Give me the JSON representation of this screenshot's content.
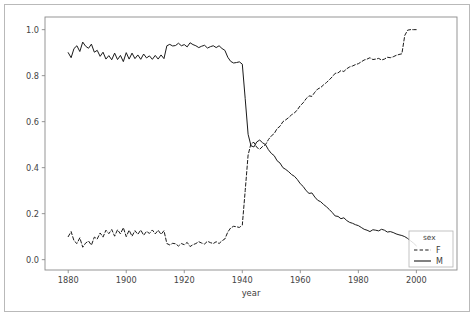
{
  "chart_data": {
    "type": "line",
    "title": "",
    "xlabel": "year",
    "ylabel": "",
    "xlim": [
      1872,
      2014
    ],
    "ylim": [
      -0.045,
      1.055
    ],
    "grid": false,
    "xticks": [
      1880,
      1900,
      1920,
      1940,
      1960,
      1980,
      2000
    ],
    "xtick_labels": [
      "1880",
      "1900",
      "1920",
      "1940",
      "1960",
      "1980",
      "2000"
    ],
    "yticks": [
      0.0,
      0.2,
      0.4,
      0.6,
      0.8,
      1.0
    ],
    "ytick_labels": [
      "0.0",
      "0.2",
      "0.4",
      "0.6",
      "0.8",
      "1.0"
    ],
    "legend": {
      "title": "sex",
      "position": "lower-right-inside",
      "entries": [
        {
          "name": "F",
          "style": "dashed",
          "color": "#1a1a1a"
        },
        {
          "name": "M",
          "style": "solid",
          "color": "#1a1a1a"
        }
      ]
    },
    "x": [
      1880,
      1881,
      1882,
      1883,
      1884,
      1885,
      1886,
      1887,
      1888,
      1889,
      1890,
      1891,
      1892,
      1893,
      1894,
      1895,
      1896,
      1897,
      1898,
      1899,
      1900,
      1901,
      1902,
      1903,
      1904,
      1905,
      1906,
      1907,
      1908,
      1909,
      1910,
      1911,
      1912,
      1913,
      1914,
      1915,
      1916,
      1917,
      1918,
      1919,
      1920,
      1921,
      1922,
      1923,
      1924,
      1925,
      1926,
      1927,
      1928,
      1929,
      1930,
      1931,
      1932,
      1933,
      1934,
      1935,
      1936,
      1937,
      1938,
      1939,
      1940,
      1941,
      1942,
      1943,
      1944,
      1945,
      1946,
      1947,
      1948,
      1949,
      1950,
      1951,
      1952,
      1953,
      1954,
      1955,
      1956,
      1957,
      1958,
      1959,
      1960,
      1961,
      1962,
      1963,
      1964,
      1965,
      1966,
      1967,
      1968,
      1969,
      1970,
      1971,
      1972,
      1973,
      1974,
      1975,
      1976,
      1977,
      1978,
      1979,
      1980,
      1981,
      1982,
      1983,
      1984,
      1985,
      1986,
      1987,
      1988,
      1989,
      1990,
      1991,
      1992,
      1993,
      1994,
      1995,
      1996,
      1997,
      1998,
      1999,
      2000
    ],
    "series": [
      {
        "name": "M",
        "style": "solid",
        "color": "#1a1a1a",
        "values": [
          0.9,
          0.878,
          0.918,
          0.93,
          0.905,
          0.946,
          0.928,
          0.919,
          0.937,
          0.902,
          0.91,
          0.884,
          0.902,
          0.872,
          0.887,
          0.869,
          0.898,
          0.87,
          0.888,
          0.861,
          0.9,
          0.872,
          0.898,
          0.874,
          0.89,
          0.871,
          0.894,
          0.877,
          0.886,
          0.871,
          0.888,
          0.872,
          0.89,
          0.874,
          0.93,
          0.936,
          0.929,
          0.931,
          0.941,
          0.93,
          0.935,
          0.925,
          0.943,
          0.935,
          0.93,
          0.922,
          0.928,
          0.932,
          0.92,
          0.926,
          0.93,
          0.922,
          0.93,
          0.918,
          0.91,
          0.88,
          0.862,
          0.855,
          0.857,
          0.86,
          0.85,
          0.7,
          0.545,
          0.495,
          0.49,
          0.512,
          0.52,
          0.508,
          0.5,
          0.478,
          0.462,
          0.452,
          0.43,
          0.42,
          0.4,
          0.392,
          0.382,
          0.37,
          0.362,
          0.348,
          0.33,
          0.318,
          0.3,
          0.288,
          0.29,
          0.272,
          0.258,
          0.252,
          0.24,
          0.23,
          0.218,
          0.205,
          0.19,
          0.188,
          0.178,
          0.182,
          0.17,
          0.162,
          0.158,
          0.152,
          0.148,
          0.14,
          0.132,
          0.128,
          0.122,
          0.13,
          0.128,
          0.125,
          0.132,
          0.128,
          0.12,
          0.122,
          0.118,
          0.112,
          0.108,
          0.105,
          0.1,
          0.092,
          0.082,
          0.072,
          0.06
        ],
        "note": "solid line, starts high ~0.90, plateau ~0.93 1914-1940, steep drop at 1941-1944 to ~0.49, then gradual decline to ~0.06"
      },
      {
        "name": "F",
        "style": "dashed",
        "color": "#1a1a1a",
        "values": [
          0.1,
          0.122,
          0.082,
          0.07,
          0.095,
          0.054,
          0.072,
          0.081,
          0.063,
          0.098,
          0.09,
          0.116,
          0.098,
          0.128,
          0.113,
          0.131,
          0.102,
          0.13,
          0.112,
          0.139,
          0.1,
          0.128,
          0.102,
          0.126,
          0.11,
          0.129,
          0.106,
          0.123,
          0.114,
          0.129,
          0.112,
          0.128,
          0.11,
          0.126,
          0.07,
          0.064,
          0.071,
          0.069,
          0.059,
          0.07,
          0.065,
          0.075,
          0.057,
          0.065,
          0.07,
          0.078,
          0.072,
          0.068,
          0.08,
          0.074,
          0.07,
          0.078,
          0.07,
          0.082,
          0.09,
          0.12,
          0.138,
          0.145,
          0.143,
          0.14,
          0.15,
          0.3,
          0.455,
          0.505,
          0.51,
          0.488,
          0.48,
          0.492,
          0.5,
          0.522,
          0.538,
          0.548,
          0.57,
          0.58,
          0.6,
          0.608,
          0.618,
          0.63,
          0.638,
          0.652,
          0.67,
          0.682,
          0.7,
          0.712,
          0.71,
          0.728,
          0.742,
          0.748,
          0.76,
          0.77,
          0.782,
          0.795,
          0.81,
          0.812,
          0.822,
          0.818,
          0.83,
          0.838,
          0.842,
          0.848,
          0.852,
          0.86,
          0.868,
          0.872,
          0.878,
          0.87,
          0.872,
          0.875,
          0.868,
          0.872,
          0.88,
          0.878,
          0.882,
          0.888,
          0.892,
          0.895,
          0.975,
          0.998,
          1.0,
          1.0,
          1.0
        ],
        "note": "dashed line, low ~0.10 until 1913, drops to ~0.07, rises steeply 1941-1944 to ~0.51, climbs to 1.0 by 1996"
      }
    ]
  }
}
